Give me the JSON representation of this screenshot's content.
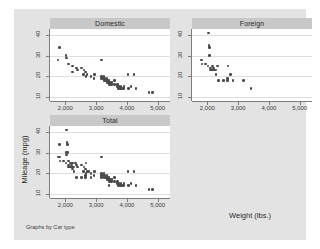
{
  "chart_data": {
    "type": "scatter",
    "title": "",
    "xlabel": "Weight (lbs.)",
    "ylabel": "Mileage (mpg)",
    "note": "Graphs by Car type",
    "grid": true,
    "legend": "none",
    "xlim": [
      1500,
      5400
    ],
    "ylim": [
      8,
      43
    ],
    "xticks": [
      2000,
      3000,
      4000,
      5000
    ],
    "xticklabels": [
      "2,000",
      "3,000",
      "4,000",
      "5,000"
    ],
    "yticks": [
      10,
      20,
      30,
      40
    ],
    "yticklabels": [
      "10",
      "20",
      "30",
      "40"
    ],
    "panels": [
      {
        "label": "Domestic",
        "row": 0,
        "col": 0,
        "points": [
          [
            1800,
            34
          ],
          [
            1760,
            28
          ],
          [
            2020,
            30
          ],
          [
            2030,
            29
          ],
          [
            2110,
            26
          ],
          [
            2240,
            25
          ],
          [
            2230,
            22
          ],
          [
            2370,
            24
          ],
          [
            2390,
            23
          ],
          [
            2520,
            24
          ],
          [
            2600,
            23
          ],
          [
            2580,
            21
          ],
          [
            2650,
            22
          ],
          [
            2670,
            20
          ],
          [
            2700,
            21
          ],
          [
            2830,
            20
          ],
          [
            3180,
            28
          ],
          [
            2930,
            19
          ],
          [
            2950,
            21
          ],
          [
            3170,
            19
          ],
          [
            3180,
            20
          ],
          [
            3220,
            19
          ],
          [
            3250,
            18
          ],
          [
            3260,
            20
          ],
          [
            3280,
            19
          ],
          [
            3310,
            18
          ],
          [
            3330,
            18
          ],
          [
            3350,
            19
          ],
          [
            3370,
            17
          ],
          [
            3380,
            18
          ],
          [
            3400,
            17
          ],
          [
            3420,
            18
          ],
          [
            3430,
            16
          ],
          [
            3470,
            17
          ],
          [
            3490,
            16
          ],
          [
            3510,
            17
          ],
          [
            3600,
            16
          ],
          [
            3600,
            18
          ],
          [
            3690,
            16
          ],
          [
            3700,
            15
          ],
          [
            3720,
            14
          ],
          [
            3740,
            15
          ],
          [
            3790,
            14
          ],
          [
            3810,
            15
          ],
          [
            3830,
            14
          ],
          [
            3900,
            15
          ],
          [
            3880,
            14
          ],
          [
            4030,
            21
          ],
          [
            4060,
            14
          ],
          [
            4130,
            15
          ],
          [
            4230,
            21
          ],
          [
            4290,
            14
          ],
          [
            4720,
            12
          ],
          [
            4840,
            12
          ]
        ]
      },
      {
        "label": "Foreign",
        "row": 0,
        "col": 1,
        "points": [
          [
            2040,
            41
          ],
          [
            2050,
            35
          ],
          [
            2070,
            34
          ],
          [
            1800,
            28
          ],
          [
            1830,
            26
          ],
          [
            1930,
            26
          ],
          [
            2070,
            30
          ],
          [
            2020,
            25
          ],
          [
            2100,
            24
          ],
          [
            2110,
            23
          ],
          [
            2150,
            23
          ],
          [
            2160,
            25
          ],
          [
            2170,
            23
          ],
          [
            2200,
            24
          ],
          [
            2240,
            23
          ],
          [
            2280,
            23
          ],
          [
            2280,
            21
          ],
          [
            2330,
            25
          ],
          [
            2370,
            18
          ],
          [
            2520,
            18
          ],
          [
            2650,
            19
          ],
          [
            2670,
            25
          ],
          [
            2650,
            18
          ],
          [
            2750,
            21
          ],
          [
            2830,
            18
          ],
          [
            3170,
            18
          ],
          [
            3420,
            14
          ]
        ]
      },
      {
        "label": "Total",
        "row": 1,
        "col": 0,
        "points": [
          [
            1800,
            34
          ],
          [
            1760,
            28
          ],
          [
            2020,
            30
          ],
          [
            2030,
            29
          ],
          [
            2110,
            26
          ],
          [
            2240,
            25
          ],
          [
            2230,
            22
          ],
          [
            2370,
            24
          ],
          [
            2390,
            23
          ],
          [
            2520,
            24
          ],
          [
            2600,
            23
          ],
          [
            2580,
            21
          ],
          [
            2650,
            22
          ],
          [
            2670,
            20
          ],
          [
            2700,
            21
          ],
          [
            2830,
            20
          ],
          [
            3180,
            28
          ],
          [
            2930,
            19
          ],
          [
            2950,
            21
          ],
          [
            3170,
            19
          ],
          [
            3180,
            20
          ],
          [
            3220,
            19
          ],
          [
            3250,
            18
          ],
          [
            3260,
            20
          ],
          [
            3280,
            19
          ],
          [
            3310,
            18
          ],
          [
            3330,
            18
          ],
          [
            3350,
            19
          ],
          [
            3370,
            17
          ],
          [
            3380,
            18
          ],
          [
            3400,
            17
          ],
          [
            3420,
            18
          ],
          [
            3430,
            16
          ],
          [
            3470,
            17
          ],
          [
            3490,
            16
          ],
          [
            3510,
            17
          ],
          [
            3600,
            16
          ],
          [
            3600,
            18
          ],
          [
            3690,
            16
          ],
          [
            3700,
            15
          ],
          [
            3720,
            14
          ],
          [
            3740,
            15
          ],
          [
            3790,
            14
          ],
          [
            3810,
            15
          ],
          [
            3830,
            14
          ],
          [
            3900,
            15
          ],
          [
            3880,
            14
          ],
          [
            4030,
            21
          ],
          [
            4060,
            14
          ],
          [
            4130,
            15
          ],
          [
            4230,
            21
          ],
          [
            4290,
            14
          ],
          [
            4720,
            12
          ],
          [
            4840,
            12
          ],
          [
            2040,
            41
          ],
          [
            2050,
            35
          ],
          [
            2070,
            34
          ],
          [
            1800,
            28
          ],
          [
            1830,
            26
          ],
          [
            1930,
            26
          ],
          [
            2070,
            30
          ],
          [
            2020,
            25
          ],
          [
            2100,
            24
          ],
          [
            2110,
            23
          ],
          [
            2150,
            23
          ],
          [
            2160,
            25
          ],
          [
            2170,
            23
          ],
          [
            2200,
            24
          ],
          [
            2240,
            23
          ],
          [
            2280,
            23
          ],
          [
            2280,
            21
          ],
          [
            2330,
            25
          ],
          [
            2370,
            18
          ],
          [
            2520,
            18
          ],
          [
            2650,
            19
          ],
          [
            2670,
            25
          ],
          [
            2650,
            18
          ],
          [
            2750,
            21
          ],
          [
            2830,
            18
          ],
          [
            3170,
            18
          ],
          [
            3420,
            14
          ]
        ]
      }
    ]
  },
  "colors": {
    "canvas": "#e3e3e3",
    "plot_background": "#ffffff",
    "title_bar": "#c8c8c8",
    "marker": "#4a4a4a",
    "gridline": "#dedede",
    "axis": "#7d7d7d"
  }
}
